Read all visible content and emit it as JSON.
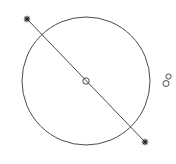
{
  "canvas": {
    "width": 176,
    "height": 164,
    "background": "#ffffff",
    "stroke_color": "#4a4a4a"
  },
  "diagram": {
    "type": "geometric-figure",
    "circle": {
      "cx": 86,
      "cy": 81,
      "r": 64
    },
    "center_point": {
      "cx": 86,
      "cy": 81,
      "r": 3.2
    },
    "diameter_line": {
      "x1": 27,
      "y1": 19,
      "x2": 145,
      "y2": 142
    },
    "endpoints": [
      {
        "name": "start-star",
        "x": 27,
        "y": 19,
        "icon": "star-marker"
      },
      {
        "name": "end-star",
        "x": 145,
        "y": 142,
        "icon": "star-marker"
      }
    ],
    "side_symbol": {
      "icon": "figure-eight-glyph",
      "upper": {
        "cx": 168.5,
        "cy": 76.5,
        "r": 2.6
      },
      "lower": {
        "cx": 166,
        "cy": 83.5,
        "r": 3
      }
    }
  }
}
